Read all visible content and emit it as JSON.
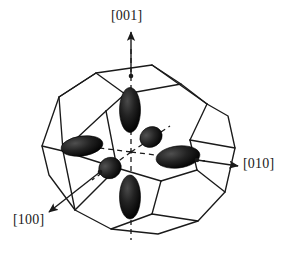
{
  "figure": {
    "background_color": "#ffffff",
    "line_color": "#1a1a1a",
    "ellipsoid_color": "#111111",
    "width": 289,
    "height": 262
  },
  "axes": [
    {
      "id": "001",
      "label": "[001]",
      "direction": "up",
      "arrow_from": [
        131,
        73
      ],
      "arrow_to": [
        131,
        31
      ],
      "label_pos": [
        111,
        8
      ]
    },
    {
      "id": "010",
      "label": "[010]",
      "direction": "right",
      "arrow_from": [
        197,
        160
      ],
      "arrow_to": [
        239,
        166
      ],
      "label_pos": [
        243,
        156
      ]
    },
    {
      "id": "100",
      "label": "[100]",
      "direction": "down-left",
      "arrow_from": [
        100,
        172
      ],
      "arrow_to": [
        47,
        214
      ],
      "label_pos": [
        13,
        212
      ]
    }
  ],
  "center_point": [
    131,
    152
  ],
  "polyhedron": {
    "type": "truncated-octahedron",
    "description": "wire-frame Brillouin zone of an fcc lattice"
  },
  "ellipsoids": [
    {
      "name": "valley-up-001",
      "cx": 130,
      "cy": 110,
      "rx": 10,
      "ry": 22,
      "rot": 0,
      "axis": "[001]"
    },
    {
      "name": "valley-down-001",
      "cx": 130,
      "cy": 197,
      "rx": 10,
      "ry": 22,
      "rot": 0,
      "axis": "[001]"
    },
    {
      "name": "valley-left-100",
      "cx": 82,
      "cy": 146,
      "rx": 21,
      "ry": 10,
      "rot": -8,
      "axis": "[100]"
    },
    {
      "name": "valley-right-010",
      "cx": 178,
      "cy": 157,
      "rx": 22,
      "ry": 11,
      "rot": -7,
      "axis": "[010]"
    },
    {
      "name": "valley-back-010",
      "cx": 151,
      "cy": 137,
      "rx": 11,
      "ry": 10,
      "rot": -30,
      "axis": "[010]"
    },
    {
      "name": "valley-front-100",
      "cx": 110,
      "cy": 168,
      "rx": 11,
      "ry": 10,
      "rot": -30,
      "axis": "[100]"
    }
  ],
  "dashed_axes": [
    {
      "name": "dashed-axis-vertical",
      "from": [
        131,
        49
      ],
      "to": [
        131,
        240
      ]
    },
    {
      "name": "dashed-axis-to-right",
      "from": [
        131,
        152
      ],
      "to": [
        205,
        161
      ]
    },
    {
      "name": "dashed-axis-to-left",
      "from": [
        131,
        152
      ],
      "to": [
        61,
        143
      ]
    },
    {
      "name": "dashed-axis-to-back",
      "from": [
        131,
        152
      ],
      "to": [
        170,
        126
      ]
    },
    {
      "name": "dashed-axis-to-front",
      "from": [
        131,
        152
      ],
      "to": [
        92,
        180
      ]
    }
  ]
}
